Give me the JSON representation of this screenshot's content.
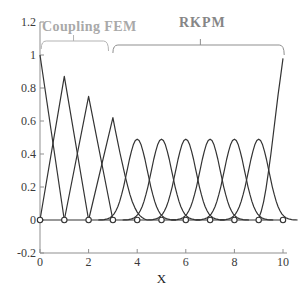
{
  "figure": {
    "width": 307,
    "height": 301,
    "background": "#ffffff"
  },
  "annotations": {
    "coupling_fem": {
      "text": "Coupling FEM",
      "color": "#a9a9a9",
      "brace_color": "#b3b3b3",
      "region_x": [
        0.05,
        2.82
      ],
      "brace_y_px": 41,
      "mid_tick_x": 1.38
    },
    "rkpm": {
      "text": "RKPM",
      "color": "#868686",
      "brace_color": "#8f8f8f",
      "region_x": [
        3.0,
        10.05
      ],
      "brace_y_px": 45,
      "mid_tick_x": 6.6
    }
  },
  "chart_data": {
    "type": "line",
    "title": "",
    "xlabel": "X",
    "ylabel": "",
    "xlim": [
      0,
      10
    ],
    "ylim": [
      -0.2,
      1.2
    ],
    "grid": false,
    "legend": "none",
    "x_ticks": [
      0,
      2,
      4,
      6,
      8,
      10
    ],
    "x_tick_labels": [
      "0",
      "2",
      "4",
      "6",
      "8",
      "10"
    ],
    "y_ticks": [
      -0.2,
      0,
      0.2,
      0.4,
      0.6,
      0.8,
      1,
      1.2
    ],
    "y_tick_labels": [
      "-0.2",
      "0",
      "0.2",
      "0.4",
      "0.6",
      "0.8",
      "1",
      "1.2"
    ],
    "node_markers_x": [
      0,
      1,
      2,
      3,
      4,
      5,
      6,
      7,
      8,
      9,
      10
    ],
    "node_markers_y": 0,
    "peak_heights": {
      "x0": 1.0,
      "x1": 0.87,
      "x2": 0.75,
      "x3": 0.62,
      "x4_to_x9": 0.49,
      "x10": 0.98
    },
    "series": [
      {
        "name": "baseline-zero",
        "type": "points",
        "points": [
          [
            0,
            0
          ],
          [
            10,
            0
          ]
        ]
      },
      {
        "name": "fem-node-0",
        "type": "points",
        "points": [
          [
            0,
            1
          ],
          [
            1,
            0
          ]
        ]
      },
      {
        "name": "fem-node-1",
        "type": "points",
        "points": [
          [
            0,
            0
          ],
          [
            1,
            0.87
          ],
          [
            2,
            0
          ]
        ]
      },
      {
        "name": "fem-node-2",
        "type": "points",
        "points": [
          [
            1,
            0
          ],
          [
            2,
            0.75
          ],
          [
            3,
            0
          ]
        ]
      },
      {
        "name": "transition-node-3",
        "type": "points",
        "points": [
          [
            2,
            0
          ],
          [
            3,
            0.62
          ],
          [
            3.1,
            0.545
          ],
          [
            3.2,
            0.47
          ],
          [
            3.3,
            0.4
          ],
          [
            3.4,
            0.335
          ],
          [
            3.5,
            0.27
          ],
          [
            3.6,
            0.21
          ],
          [
            3.7,
            0.155
          ],
          [
            3.8,
            0.11
          ],
          [
            3.9,
            0.075
          ],
          [
            4.0,
            0.048
          ],
          [
            4.1,
            0.028
          ],
          [
            4.2,
            0.015
          ],
          [
            4.3,
            0.006
          ],
          [
            4.4,
            0
          ]
        ]
      },
      {
        "name": "rkpm-node-4",
        "type": "bell",
        "center": 4,
        "peak": 0.49,
        "sigma": 0.42,
        "halfwidth": 1.6
      },
      {
        "name": "rkpm-node-5",
        "type": "bell",
        "center": 5,
        "peak": 0.49,
        "sigma": 0.42,
        "halfwidth": 1.6
      },
      {
        "name": "rkpm-node-6",
        "type": "bell",
        "center": 6,
        "peak": 0.49,
        "sigma": 0.42,
        "halfwidth": 1.6
      },
      {
        "name": "rkpm-node-7",
        "type": "bell",
        "center": 7,
        "peak": 0.49,
        "sigma": 0.42,
        "halfwidth": 1.6
      },
      {
        "name": "rkpm-node-8",
        "type": "bell",
        "center": 8,
        "peak": 0.49,
        "sigma": 0.42,
        "halfwidth": 1.6
      },
      {
        "name": "rkpm-node-9",
        "type": "bell",
        "center": 9,
        "peak": 0.49,
        "sigma": 0.42,
        "halfwidth": 1.6
      },
      {
        "name": "rkpm-node-10",
        "type": "points",
        "points": [
          [
            8.9,
            0
          ],
          [
            9.0,
            0.01
          ],
          [
            9.1,
            0.05
          ],
          [
            9.2,
            0.11
          ],
          [
            9.3,
            0.19
          ],
          [
            9.4,
            0.29
          ],
          [
            9.5,
            0.4
          ],
          [
            9.6,
            0.52
          ],
          [
            9.7,
            0.64
          ],
          [
            9.8,
            0.76
          ],
          [
            9.9,
            0.87
          ],
          [
            10,
            0.98
          ]
        ]
      }
    ],
    "style": {
      "line_color": "#333333",
      "line_width": 1.2,
      "axis_color": "#8f8f8f",
      "tick_label_color": "#3a3a3a",
      "marker_shape": "circle",
      "marker_radius": 2.7,
      "marker_fill": "#ffffff",
      "marker_stroke": "#333333"
    }
  }
}
